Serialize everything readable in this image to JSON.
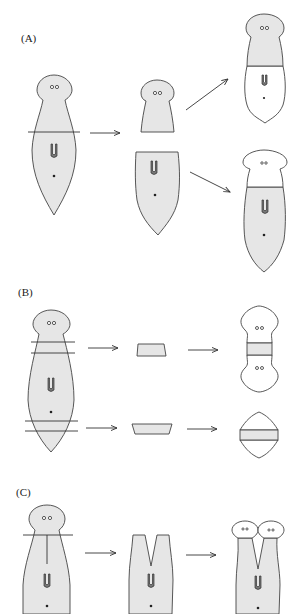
{
  "figure": {
    "panels": [
      {
        "label": "(A)",
        "description": "Transverse cut: head piece regenerates tail, tail piece regenerates head"
      },
      {
        "label": "(B)",
        "description": "Thin transverse slices regenerate two heads or two tails"
      },
      {
        "label": "(C)",
        "description": "Longitudinal split of head region regenerates two heads"
      }
    ],
    "colors": {
      "original_tissue": "#e6e6e6",
      "regenerated_tissue": "#ffffff",
      "outline": "#444444"
    }
  }
}
